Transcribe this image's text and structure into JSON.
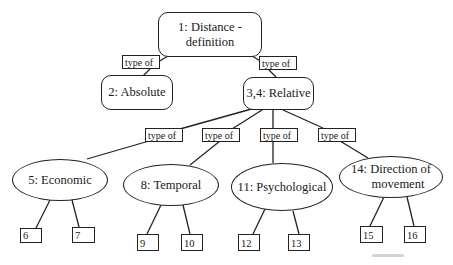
{
  "diagram": {
    "type": "concept-tree",
    "root": {
      "id": "1",
      "label": "1:  Distance - definition",
      "line1": "1:  Distance -",
      "line2": "definition"
    },
    "level1": [
      {
        "id": "2",
        "label": "2:  Absolute",
        "relation": "type of"
      },
      {
        "id": "3,4",
        "label": "3,4:  Relative",
        "relation": "type of"
      }
    ],
    "level2": [
      {
        "id": "5",
        "label": "5:  Economic",
        "relation": "type of",
        "children": [
          "6",
          "7"
        ]
      },
      {
        "id": "8",
        "label": "8:  Temporal",
        "relation": "type of",
        "children": [
          "9",
          "10"
        ]
      },
      {
        "id": "11",
        "label": "11:  Psychological",
        "relation": "type of",
        "children": [
          "12",
          "13"
        ]
      },
      {
        "id": "14",
        "label": "14:  Direction of movement",
        "line1": "14:  Direction of",
        "line2": "movement",
        "relation": "type of",
        "children": [
          "15",
          "16"
        ]
      }
    ],
    "leaves": [
      "6",
      "7",
      "9",
      "10",
      "12",
      "13",
      "15",
      "16"
    ],
    "relation_label": "type of"
  }
}
